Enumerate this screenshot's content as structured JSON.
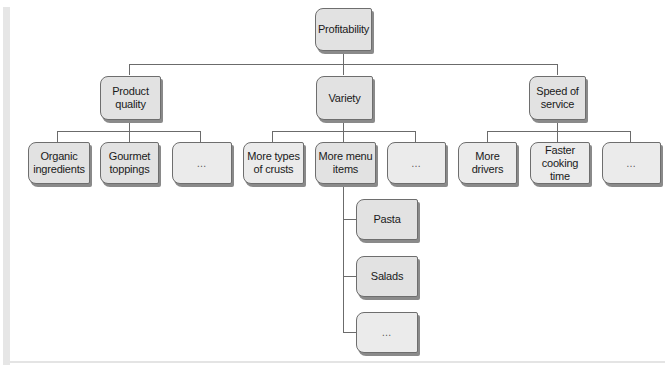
{
  "diagram": {
    "type": "hierarchy-tree",
    "root": {
      "label": "Profitability"
    },
    "level2": [
      {
        "label": "Product\nquality"
      },
      {
        "label": "Variety"
      },
      {
        "label": "Speed of\nservice"
      }
    ],
    "product_quality_children": [
      {
        "label": "Organic\ningredients"
      },
      {
        "label": "Gourmet\ntoppings"
      },
      {
        "label": "…"
      }
    ],
    "variety_children": [
      {
        "label": "More types\nof crusts"
      },
      {
        "label": "More menu\nitems"
      },
      {
        "label": "…"
      }
    ],
    "speed_children": [
      {
        "label": "More\ndrivers"
      },
      {
        "label": "Faster\ncooking\ntime"
      },
      {
        "label": "…"
      }
    ],
    "menu_items_children": [
      {
        "label": "Pasta"
      },
      {
        "label": "Salads"
      },
      {
        "label": "…"
      }
    ],
    "colors": {
      "node_fill": "#e2e2e2",
      "node_fill_light": "#ebebeb",
      "node_border": "#6e6e6e",
      "node_shadow": "#8a8a8a",
      "connector": "#6b6b6b",
      "text": "#1a1a1a"
    }
  }
}
